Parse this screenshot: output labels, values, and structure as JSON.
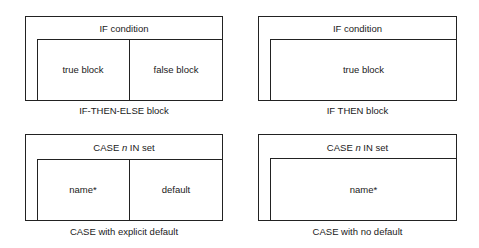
{
  "diagrams": [
    {
      "header": "IF condition",
      "cells": [
        "true block",
        "false block"
      ],
      "caption": "IF-THEN-ELSE block"
    },
    {
      "header": "IF condition",
      "cells": [
        "true block"
      ],
      "caption": "IF THEN block"
    },
    {
      "header_prefix": "CASE ",
      "header_var": "n",
      "header_suffix": " IN set",
      "cells": [
        "name*",
        "default"
      ],
      "caption": "CASE with explicit default"
    },
    {
      "header_prefix": "CASE ",
      "header_var": "n",
      "header_suffix": " IN set",
      "cells": [
        "name*"
      ],
      "caption": "CASE with no default"
    }
  ]
}
